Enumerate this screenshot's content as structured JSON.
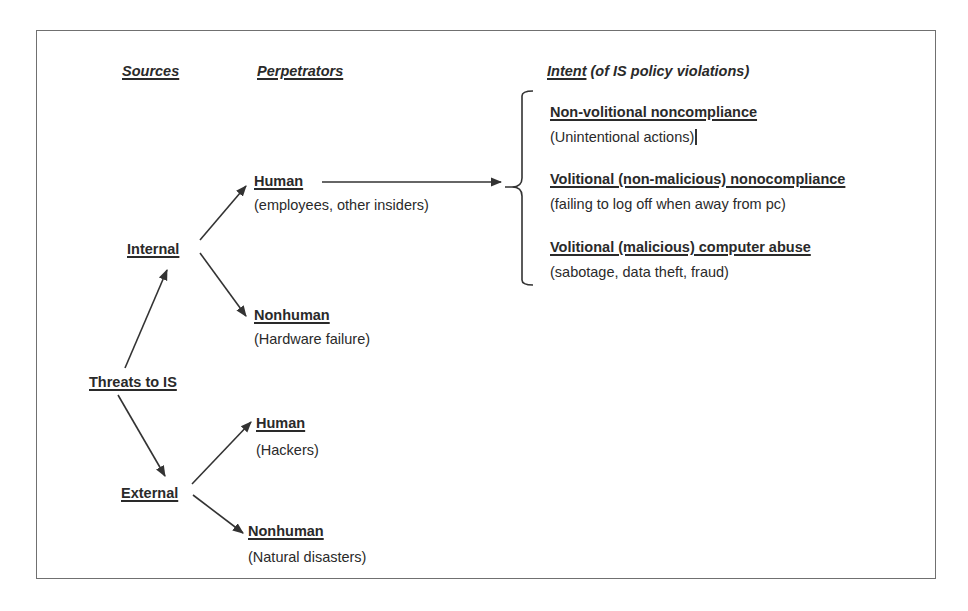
{
  "headers": {
    "sources": "Sources",
    "perpetrators": "Perpetrators",
    "intent_underlined": "Intent",
    "intent_rest": " (of IS policy violations)"
  },
  "root": {
    "label": "Threats to IS"
  },
  "sources": [
    {
      "label": "Internal"
    },
    {
      "label": "External"
    }
  ],
  "perpetrators": {
    "internal_human": {
      "label": "Human",
      "desc": "(employees, other insiders)"
    },
    "internal_nonhuman": {
      "label": "Nonhuman",
      "desc": "(Hardware failure)"
    },
    "external_human": {
      "label": "Human",
      "desc": "(Hackers)"
    },
    "external_nonhuman": {
      "label": "Nonhuman",
      "desc": "(Natural disasters)"
    }
  },
  "intents": [
    {
      "label": "Non-volitional noncompliance",
      "desc": "(Unintentional actions)"
    },
    {
      "label": "Volitional (non-malicious) nonocompliance",
      "desc": "(failing to log off when away from pc)"
    },
    {
      "label": "Volitional (malicious) computer abuse",
      "desc": "(sabotage, data theft, fraud)"
    }
  ],
  "colors": {
    "line": "#333333",
    "frame": "#707070",
    "text": "#2a2a2a"
  }
}
